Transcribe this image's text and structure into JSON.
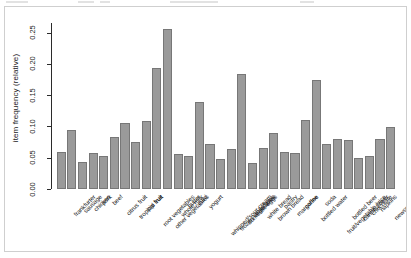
{
  "window": {
    "background_color": "#ffffff",
    "panel_border_color": "#cfcfcf"
  },
  "chart_data": {
    "type": "bar",
    "title": "",
    "subtitle": "",
    "xlabel": "",
    "ylabel": "item frequency (relative)",
    "ylim": [
      0.0,
      0.2655
    ],
    "grid": false,
    "legend": null,
    "bar_color": "#9a9a9a",
    "bar_border_color": "#777777",
    "axis_color": "#2b2b2b",
    "label_rotation_deg": 45,
    "ytick_labels": [
      "0.00",
      "0.05",
      "0.10",
      "0.15",
      "0.20",
      "0.25"
    ],
    "ytick_values": [
      0.0,
      0.05,
      0.1,
      0.15,
      0.2,
      0.25
    ],
    "categories": [
      "frankfurter",
      "sausage",
      "chicken",
      "pork",
      "beef",
      "citrus fruit",
      "tropical fruit",
      "pip fruit",
      "root vegetables",
      "other vegetables",
      "whole milk",
      "butter",
      "curd",
      "yogurt",
      "whipped/sour cream",
      "frozen vegetables",
      "domestic eggs",
      "rolls/buns",
      "white bread",
      "brown bread",
      "pastry",
      "margarine",
      "coffee",
      "bottled water",
      "soda",
      "fruit/vegetable juice",
      "bottled beer",
      "canned beer",
      "chocolate",
      "napkins",
      "newspapers",
      "shopping bags"
    ],
    "values": [
      0.0589,
      0.0939,
      0.0429,
      0.0576,
      0.0525,
      0.0828,
      0.1049,
      0.0757,
      0.109,
      0.1935,
      0.2555,
      0.0554,
      0.0533,
      0.1395,
      0.0717,
      0.0481,
      0.0635,
      0.1839,
      0.0421,
      0.0648,
      0.089,
      0.0585,
      0.058,
      0.1105,
      0.1744,
      0.0723,
      0.0805,
      0.0777,
      0.0496,
      0.0523,
      0.0798,
      0.0985
    ]
  }
}
